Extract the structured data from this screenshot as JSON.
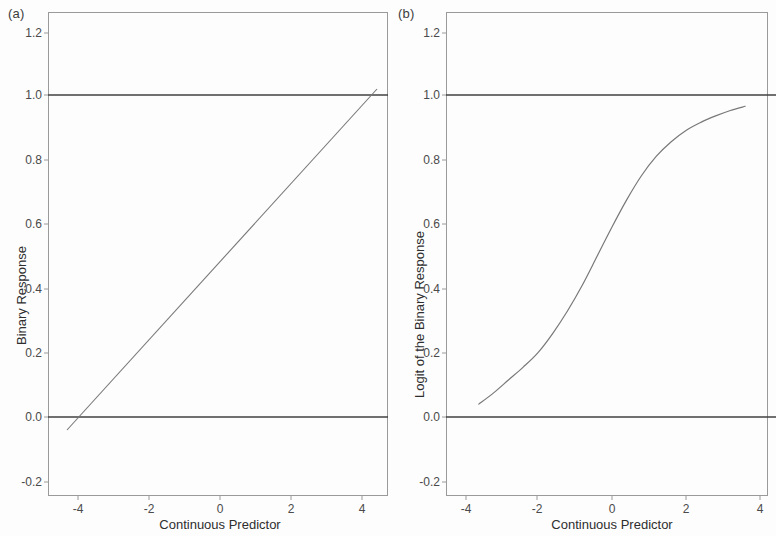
{
  "figure": {
    "background_color": "#fdfdfd",
    "line_color": "#6f6f6f",
    "axis_color": "#9a9a9a",
    "text_color": "#3a3a3a"
  },
  "panels": [
    {
      "label": "(a)",
      "xlabel": "Continuous Predictor",
      "ylabel": "Binary Response"
    },
    {
      "label": "(b)",
      "xlabel": "Continuous Predictor",
      "ylabel": "Logit of the Binary Response"
    }
  ],
  "ticks": {
    "y": [
      "1.2",
      "1.0",
      "0.8",
      "0.6",
      "0.4",
      "0.2",
      "0.0",
      "-0.2"
    ],
    "x": [
      "-4",
      "-2",
      "0",
      "2",
      "4"
    ]
  },
  "chart_data": [
    {
      "type": "line",
      "title": "(a)",
      "subtitle": "Linear probability model fitted to a binary response",
      "xlabel": "Continuous Predictor",
      "ylabel": "Binary Response",
      "xlim": [
        -4.8,
        4.8
      ],
      "ylim": [
        -0.28,
        1.28
      ],
      "xticks": [
        -4,
        -2,
        0,
        2,
        4
      ],
      "yticks": [
        -0.2,
        0.0,
        0.2,
        0.4,
        0.6,
        0.8,
        1.0,
        1.2
      ],
      "grid": false,
      "legend": null,
      "series": [
        {
          "name": "Reference line at y = 1.0",
          "style": "horizontal-reference",
          "x": [
            -4.8,
            4.8
          ],
          "values": [
            1.0,
            1.0
          ]
        },
        {
          "name": "Reference line at y = 0.0",
          "style": "horizontal-reference",
          "x": [
            -4.8,
            4.8
          ],
          "values": [
            0.0,
            0.0
          ]
        },
        {
          "name": "Fitted linear probability",
          "style": "straight-line",
          "x": [
            -4.25,
            -4.0,
            -3.0,
            -2.0,
            -1.0,
            0.0,
            1.0,
            2.0,
            3.0,
            4.0,
            4.35
          ],
          "values": [
            -0.04,
            0.0,
            0.122,
            0.244,
            0.366,
            0.488,
            0.61,
            0.732,
            0.854,
            0.976,
            1.018
          ]
        }
      ],
      "annotations": [
        "Fitted line crosses 0.0 near x = -4.0",
        "Fitted line crosses 1.0 near x = 4.2"
      ]
    },
    {
      "type": "line",
      "title": "(b)",
      "subtitle": "Logistic (logit) model fitted to the same binary response",
      "xlabel": "Continuous Predictor",
      "ylabel": "Logit of the Binary Response",
      "xlim": [
        -4.8,
        4.8
      ],
      "ylim": [
        -0.28,
        1.28
      ],
      "xticks": [
        -4,
        -2,
        0,
        2,
        4
      ],
      "yticks": [
        -0.2,
        0.0,
        0.2,
        0.4,
        0.6,
        0.8,
        1.0,
        1.2
      ],
      "grid": false,
      "legend": null,
      "series": [
        {
          "name": "Reference line at y = 1.0",
          "style": "horizontal-reference",
          "x": [
            -4.8,
            4.8
          ],
          "values": [
            1.0,
            1.0
          ]
        },
        {
          "name": "Reference line at y = 0.0",
          "style": "horizontal-reference",
          "x": [
            -4.8,
            4.8
          ],
          "values": [
            0.0,
            0.0
          ]
        },
        {
          "name": "Fitted logistic curve",
          "style": "sigmoid",
          "x": [
            -3.6,
            -3.2,
            -2.8,
            -2.4,
            -2.0,
            -1.6,
            -1.2,
            -0.8,
            -0.4,
            0.0,
            0.4,
            0.8,
            1.2,
            1.6,
            2.0,
            2.4,
            2.8,
            3.2,
            3.6
          ],
          "values": [
            0.04,
            0.075,
            0.115,
            0.155,
            0.2,
            0.26,
            0.33,
            0.41,
            0.5,
            0.59,
            0.675,
            0.75,
            0.81,
            0.855,
            0.89,
            0.915,
            0.935,
            0.952,
            0.965
          ]
        }
      ],
      "annotations": [
        "Curve is S-shaped and stays between 0 and 1",
        "Inflection near x = 0, y = 0.5"
      ]
    }
  ]
}
